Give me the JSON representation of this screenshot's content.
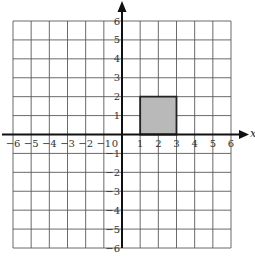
{
  "chart_data": {
    "type": "scatter",
    "title": "",
    "xlabel": "x",
    "ylabel": "",
    "xlim": [
      -6,
      6
    ],
    "ylim": [
      -6,
      6
    ],
    "grid": true,
    "grid_step": 1,
    "x_tick_labels": [
      "−6",
      "−5",
      "−4",
      "−3",
      "−2",
      "−1",
      "0",
      "1",
      "2",
      "3",
      "4",
      "5",
      "6"
    ],
    "x_tick_values": [
      -6,
      -5,
      -4,
      -3,
      -2,
      -1,
      0,
      1,
      2,
      3,
      4,
      5,
      6
    ],
    "y_tick_labels": [
      "−6",
      "−5",
      "−4",
      "−3",
      "−2",
      "−1",
      "1",
      "2",
      "3",
      "4",
      "5",
      "6"
    ],
    "y_tick_values": [
      -6,
      -5,
      -4,
      -3,
      -2,
      -1,
      1,
      2,
      3,
      4,
      5,
      6
    ],
    "shapes": [
      {
        "name": "shaded-rectangle",
        "kind": "rectangle",
        "vertices": [
          [
            1,
            0
          ],
          [
            3,
            0
          ],
          [
            3,
            2
          ],
          [
            1,
            2
          ]
        ],
        "fill": "#b9b9b9",
        "stroke": "#222222"
      }
    ],
    "colors": {
      "grid": "#5a5a5a",
      "axis": "#111111",
      "background": "#ffffff"
    }
  }
}
